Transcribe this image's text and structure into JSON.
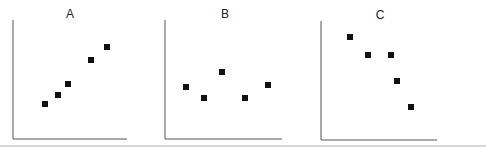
{
  "chart_data": [
    {
      "type": "scatter",
      "title": "A",
      "xlabel": "",
      "ylabel": "",
      "grid": false,
      "points_px": [
        [
          45,
          104
        ],
        [
          58,
          95
        ],
        [
          68,
          84
        ],
        [
          91,
          60
        ],
        [
          107,
          47
        ]
      ],
      "x": [
        1,
        2,
        3,
        5,
        6
      ],
      "y": [
        1,
        2,
        3,
        5,
        6
      ],
      "trend": "positive"
    },
    {
      "type": "scatter",
      "title": "B",
      "xlabel": "",
      "ylabel": "",
      "grid": false,
      "points_px": [
        [
          186,
          87
        ],
        [
          204,
          98
        ],
        [
          222,
          72
        ],
        [
          245,
          98
        ],
        [
          268,
          85
        ]
      ],
      "x": [
        1,
        2,
        3,
        4,
        5
      ],
      "y": [
        3,
        2,
        4,
        2,
        3
      ],
      "trend": "none"
    },
    {
      "type": "scatter",
      "title": "C",
      "xlabel": "",
      "ylabel": "",
      "grid": false,
      "points_px": [
        [
          350,
          37
        ],
        [
          368,
          55
        ],
        [
          391,
          55
        ],
        [
          397,
          81
        ],
        [
          411,
          107
        ]
      ],
      "x": [
        1,
        2,
        3,
        4,
        5
      ],
      "y": [
        6,
        5,
        5,
        3,
        1
      ],
      "trend": "negative"
    }
  ],
  "panels": [
    {
      "title": "A",
      "axis": {
        "x0": 13,
        "ytop": 20,
        "ybase": 139,
        "x1": 127
      }
    },
    {
      "title": "B",
      "axis": {
        "x0": 165,
        "ytop": 20,
        "ybase": 139,
        "x1": 282
      }
    },
    {
      "title": "C",
      "axis": {
        "x0": 321,
        "ytop": 21,
        "ybase": 140,
        "x1": 437
      }
    }
  ],
  "colors": {
    "axis": "#555555",
    "marker": "#111111",
    "bottom_rule": "#b0b0b0"
  }
}
